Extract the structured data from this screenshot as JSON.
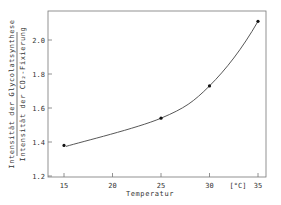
{
  "chart_data": {
    "type": "scatter",
    "title": "",
    "xlabel": "Temperatur",
    "x_unit": "[°C]",
    "ylabel_numerator": "Intensität der Glycolatsynthese",
    "ylabel_denominator": "Intensität der CO₂-Fixierung",
    "x": [
      15,
      25,
      30,
      35
    ],
    "series": [
      {
        "name": "Verhältnis Glycolatsynthese / CO₂-Fixierung",
        "values": [
          1.38,
          1.54,
          1.73,
          2.11
        ],
        "fit_curve": true
      }
    ],
    "xlim": [
      13.5,
      36
    ],
    "ylim": [
      1.2,
      2.2
    ],
    "x_ticks": [
      15,
      20,
      25,
      30,
      35
    ],
    "y_ticks": [
      1.2,
      1.4,
      1.6,
      1.8,
      2.0
    ],
    "x_tick_labels": [
      "15",
      "20",
      "25",
      "30",
      "35"
    ],
    "y_tick_labels": [
      "1.2",
      "1.4",
      "1.6",
      "1.8",
      "2.0"
    ],
    "grid": false,
    "legend": null
  },
  "colors": {
    "axis": "#666666",
    "curve": "#444444",
    "marker": "#111111"
  }
}
